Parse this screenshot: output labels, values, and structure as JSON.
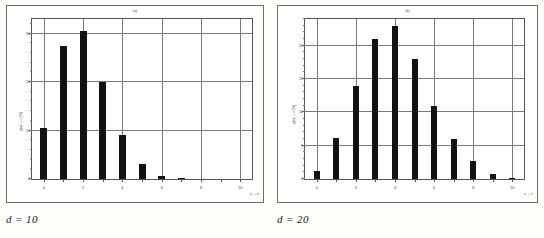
{
  "figure": {
    "background_color": "#fdfdfc",
    "ink_color": "#121212",
    "grid_color": "#7a7a7a",
    "frame_color": "#6e6e6e"
  },
  "panels": [
    {
      "id": "panel-left",
      "caption": "d = 10",
      "title": "(a)",
      "xlabel": "x ---->",
      "ylabel": "p(x) ----> [%]"
    },
    {
      "id": "panel-right",
      "caption": "d = 20",
      "title": "(b)",
      "xlabel": "x ---->",
      "ylabel": "p(x) ----> [%]"
    }
  ],
  "chart_data": [
    {
      "type": "bar",
      "title": "(a)",
      "caption": "d = 10",
      "xlabel": "x ---->",
      "ylabel": "p(x) ----> [%]",
      "categories": [
        0,
        1,
        2,
        3,
        4,
        5,
        6,
        7,
        8,
        9,
        10
      ],
      "values": [
        10.5,
        27.5,
        30.5,
        20.0,
        9.0,
        3.0,
        0.6,
        0.1,
        0.0,
        0.0,
        0.0
      ],
      "xlim": [
        -0.6,
        10.6
      ],
      "ylim": [
        0,
        33
      ],
      "xticks": [
        0,
        1,
        2,
        3,
        4,
        5,
        6,
        7,
        8,
        9,
        10
      ],
      "xtick_labels": [
        "0",
        "1",
        "2",
        "3",
        "4",
        "5",
        "6",
        "7",
        "8",
        "9",
        "10"
      ],
      "yticks": [
        0,
        10,
        20,
        30
      ],
      "ytick_labels": [
        "0",
        "10",
        "20",
        "30"
      ],
      "gridlines_x": [
        0,
        2,
        4,
        6,
        8,
        10
      ],
      "gridlines_y": [
        10,
        20,
        30
      ],
      "grid": true,
      "legend": "none"
    },
    {
      "type": "bar",
      "title": "(b)",
      "caption": "d = 20",
      "xlabel": "x ---->",
      "ylabel": "p(x) ----> [%]",
      "categories": [
        0,
        1,
        2,
        3,
        4,
        5,
        6,
        7,
        8,
        9,
        10
      ],
      "values": [
        1.2,
        6.2,
        14.0,
        21.0,
        23.0,
        18.0,
        11.0,
        6.0,
        2.7,
        0.7,
        0.2
      ],
      "xlim": [
        -0.6,
        10.6
      ],
      "ylim": [
        0,
        24
      ],
      "xticks": [
        0,
        1,
        2,
        3,
        4,
        5,
        6,
        7,
        8,
        9,
        10
      ],
      "xtick_labels": [
        "0",
        "1",
        "2",
        "3",
        "4",
        "5",
        "6",
        "7",
        "8",
        "9",
        "10"
      ],
      "yticks": [
        0,
        5,
        10,
        15,
        20
      ],
      "ytick_labels": [
        "0",
        "5",
        "10",
        "15",
        "20"
      ],
      "gridlines_x": [
        0,
        2,
        4,
        6,
        8,
        10
      ],
      "gridlines_y": [
        5,
        10,
        15,
        20
      ],
      "grid": true,
      "legend": "none"
    }
  ]
}
